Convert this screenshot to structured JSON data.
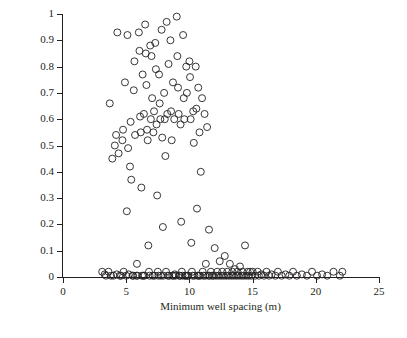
{
  "chart_data": {
    "type": "scatter",
    "title": "",
    "xlabel": "Minimum well spacing (m)",
    "ylabel_main": "EER",
    "ylabel_sub": "w7",
    "xlim": [
      0,
      25
    ],
    "ylim": [
      0,
      1
    ],
    "xticks": [
      0,
      5,
      10,
      15,
      20,
      25
    ],
    "yticks": [
      0,
      0.1,
      0.2,
      0.3,
      0.4,
      0.5,
      0.6,
      0.7,
      0.8,
      0.9,
      1
    ],
    "xtick_labels": [
      "0",
      "5",
      "10",
      "15",
      "20",
      "25"
    ],
    "ytick_labels": [
      "0",
      "0.1",
      "0.2",
      "0.3",
      "0.4",
      "0.5",
      "0.6",
      "0.7",
      "0.8",
      "0.9",
      "1"
    ],
    "grid": false,
    "legend": null,
    "marker": {
      "shape": "open-circle",
      "size": 4.6,
      "stroke": "#231f20",
      "fill": "none"
    },
    "points": [
      [
        3.1,
        0.02
      ],
      [
        3.3,
        0.01
      ],
      [
        3.4,
        0.005
      ],
      [
        3.6,
        0.02
      ],
      [
        3.7,
        0.66
      ],
      [
        3.8,
        0.005
      ],
      [
        3.9,
        0.45
      ],
      [
        4.0,
        0.005
      ],
      [
        4.1,
        0.5
      ],
      [
        4.2,
        0.54
      ],
      [
        4.25,
        0.01
      ],
      [
        4.3,
        0.93
      ],
      [
        4.4,
        0.47
      ],
      [
        4.5,
        0.005
      ],
      [
        4.6,
        0.005
      ],
      [
        4.7,
        0.52
      ],
      [
        4.75,
        0.56
      ],
      [
        4.8,
        0.02
      ],
      [
        4.9,
        0.74
      ],
      [
        5.0,
        0.005
      ],
      [
        5.05,
        0.25
      ],
      [
        5.1,
        0.92
      ],
      [
        5.15,
        0.49
      ],
      [
        5.2,
        0.01
      ],
      [
        5.3,
        0.42
      ],
      [
        5.35,
        0.59
      ],
      [
        5.4,
        0.37
      ],
      [
        5.5,
        0.005
      ],
      [
        5.55,
        0.005
      ],
      [
        5.6,
        0.71
      ],
      [
        5.65,
        0.82
      ],
      [
        5.7,
        0.54
      ],
      [
        5.8,
        0.005
      ],
      [
        5.85,
        0.05
      ],
      [
        5.9,
        0.005
      ],
      [
        6.0,
        0.93
      ],
      [
        6.05,
        0.86
      ],
      [
        6.1,
        0.61
      ],
      [
        6.15,
        0.55
      ],
      [
        6.2,
        0.34
      ],
      [
        6.25,
        0.005
      ],
      [
        6.3,
        0.77
      ],
      [
        6.35,
        0.005
      ],
      [
        6.4,
        0.62
      ],
      [
        6.45,
        0.005
      ],
      [
        6.5,
        0.96
      ],
      [
        6.55,
        0.85
      ],
      [
        6.6,
        0.73
      ],
      [
        6.65,
        0.56
      ],
      [
        6.7,
        0.52
      ],
      [
        6.75,
        0.12
      ],
      [
        6.8,
        0.02
      ],
      [
        6.85,
        0.005
      ],
      [
        6.9,
        0.88
      ],
      [
        6.95,
        0.6
      ],
      [
        7.0,
        0.84
      ],
      [
        7.05,
        0.68
      ],
      [
        7.1,
        0.005
      ],
      [
        7.15,
        0.55
      ],
      [
        7.2,
        0.63
      ],
      [
        7.25,
        0.005
      ],
      [
        7.3,
        0.89
      ],
      [
        7.35,
        0.79
      ],
      [
        7.4,
        0.58
      ],
      [
        7.45,
        0.31
      ],
      [
        7.5,
        0.02
      ],
      [
        7.55,
        0.005
      ],
      [
        7.6,
        0.77
      ],
      [
        7.65,
        0.66
      ],
      [
        7.7,
        0.6
      ],
      [
        7.75,
        0.005
      ],
      [
        7.8,
        0.94
      ],
      [
        7.85,
        0.53
      ],
      [
        7.9,
        0.19
      ],
      [
        7.95,
        0.005
      ],
      [
        8.0,
        0.7
      ],
      [
        8.05,
        0.6
      ],
      [
        8.1,
        0.46
      ],
      [
        8.15,
        0.02
      ],
      [
        8.2,
        0.97
      ],
      [
        8.25,
        0.62
      ],
      [
        8.3,
        0.005
      ],
      [
        8.35,
        0.81
      ],
      [
        8.4,
        0.005
      ],
      [
        8.5,
        0.9
      ],
      [
        8.55,
        0.63
      ],
      [
        8.6,
        0.52
      ],
      [
        8.65,
        0.005
      ],
      [
        8.7,
        0.74
      ],
      [
        8.75,
        0.005
      ],
      [
        8.8,
        0.6
      ],
      [
        8.85,
        0.01
      ],
      [
        8.9,
        0.005
      ],
      [
        9.0,
        0.99
      ],
      [
        9.05,
        0.84
      ],
      [
        9.1,
        0.72
      ],
      [
        9.15,
        0.62
      ],
      [
        9.2,
        0.005
      ],
      [
        9.25,
        0.005
      ],
      [
        9.3,
        0.58
      ],
      [
        9.35,
        0.21
      ],
      [
        9.4,
        0.02
      ],
      [
        9.45,
        0.005
      ],
      [
        9.5,
        0.92
      ],
      [
        9.55,
        0.68
      ],
      [
        9.6,
        0.6
      ],
      [
        9.65,
        0.005
      ],
      [
        9.7,
        0.005
      ],
      [
        9.75,
        0.8
      ],
      [
        9.8,
        0.7
      ],
      [
        9.85,
        0.005
      ],
      [
        9.9,
        0.005
      ],
      [
        10.0,
        0.82
      ],
      [
        10.05,
        0.76
      ],
      [
        10.1,
        0.6
      ],
      [
        10.15,
        0.13
      ],
      [
        10.2,
        0.02
      ],
      [
        10.25,
        0.005
      ],
      [
        10.3,
        0.63
      ],
      [
        10.35,
        0.51
      ],
      [
        10.4,
        0.005
      ],
      [
        10.5,
        0.8
      ],
      [
        10.55,
        0.64
      ],
      [
        10.6,
        0.26
      ],
      [
        10.65,
        0.005
      ],
      [
        10.7,
        0.72
      ],
      [
        10.75,
        0.005
      ],
      [
        10.8,
        0.55
      ],
      [
        10.85,
        0.005
      ],
      [
        10.9,
        0.4
      ],
      [
        11.0,
        0.68
      ],
      [
        11.05,
        0.02
      ],
      [
        11.1,
        0.005
      ],
      [
        11.2,
        0.62
      ],
      [
        11.25,
        0.005
      ],
      [
        11.3,
        0.05
      ],
      [
        11.4,
        0.57
      ],
      [
        11.5,
        0.005
      ],
      [
        11.55,
        0.18
      ],
      [
        11.6,
        0.005
      ],
      [
        11.7,
        0.02
      ],
      [
        11.8,
        0.005
      ],
      [
        11.9,
        0.005
      ],
      [
        12.0,
        0.11
      ],
      [
        12.1,
        0.005
      ],
      [
        12.2,
        0.02
      ],
      [
        12.3,
        0.005
      ],
      [
        12.4,
        0.06
      ],
      [
        12.5,
        0.005
      ],
      [
        12.6,
        0.02
      ],
      [
        12.7,
        0.005
      ],
      [
        12.8,
        0.08
      ],
      [
        12.9,
        0.005
      ],
      [
        13.0,
        0.02
      ],
      [
        13.1,
        0.005
      ],
      [
        13.2,
        0.05
      ],
      [
        13.3,
        0.005
      ],
      [
        13.4,
        0.02
      ],
      [
        13.5,
        0.005
      ],
      [
        13.6,
        0.03
      ],
      [
        13.7,
        0.005
      ],
      [
        13.8,
        0.02
      ],
      [
        13.9,
        0.005
      ],
      [
        14.0,
        0.04
      ],
      [
        14.1,
        0.005
      ],
      [
        14.2,
        0.02
      ],
      [
        14.3,
        0.005
      ],
      [
        14.4,
        0.12
      ],
      [
        14.5,
        0.005
      ],
      [
        14.6,
        0.02
      ],
      [
        14.7,
        0.005
      ],
      [
        14.8,
        0.02
      ],
      [
        14.9,
        0.005
      ],
      [
        15.0,
        0.02
      ],
      [
        15.2,
        0.005
      ],
      [
        15.4,
        0.02
      ],
      [
        15.5,
        0.005
      ],
      [
        15.7,
        0.01
      ],
      [
        15.9,
        0.005
      ],
      [
        16.1,
        0.02
      ],
      [
        16.3,
        0.005
      ],
      [
        16.5,
        0.01
      ],
      [
        16.8,
        0.005
      ],
      [
        17.0,
        0.02
      ],
      [
        17.3,
        0.005
      ],
      [
        17.6,
        0.01
      ],
      [
        17.9,
        0.005
      ],
      [
        18.2,
        0.02
      ],
      [
        18.5,
        0.005
      ],
      [
        18.9,
        0.01
      ],
      [
        19.3,
        0.005
      ],
      [
        19.7,
        0.02
      ],
      [
        20.1,
        0.005
      ],
      [
        20.5,
        0.01
      ],
      [
        20.9,
        0.005
      ],
      [
        21.4,
        0.02
      ],
      [
        21.9,
        0.005
      ],
      [
        22.1,
        0.02
      ]
    ]
  }
}
